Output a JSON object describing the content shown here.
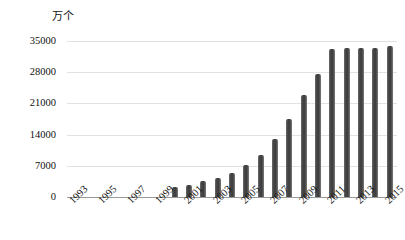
{
  "chart": {
    "unit_label": "万个",
    "y_axis": {
      "ticks": [
        "0",
        "7000",
        "14000",
        "21000",
        "28000",
        "35000"
      ],
      "min": 0,
      "max": 35000
    },
    "x_axis": {
      "tick_labels": [
        "1993",
        "1995",
        "1997",
        "1999",
        "2001",
        "2003",
        "2005",
        "2007",
        "2009",
        "2011",
        "2013",
        "2015"
      ]
    },
    "colors": {
      "bar": "#4a4a4a",
      "gridline": "#e2e2e2",
      "axis": "#9a9a9a",
      "text": "#111111",
      "background": "#ffffff"
    }
  },
  "chart_data": {
    "type": "bar",
    "title": "",
    "subtitle": "",
    "xlabel": "",
    "ylabel": "万个",
    "ylim": [
      0,
      35000
    ],
    "grid": true,
    "legend": null,
    "categories": [
      "1993",
      "1994",
      "1995",
      "1996",
      "1997",
      "1998",
      "1999",
      "2000",
      "2001",
      "2002",
      "2003",
      "2004",
      "2005",
      "2006",
      "2007",
      "2008",
      "2009",
      "2010",
      "2011",
      "2012",
      "2013",
      "2014",
      "2015"
    ],
    "values": [
      0,
      0,
      0,
      0,
      0,
      0,
      0,
      2200,
      2800,
      3500,
      4300,
      5500,
      7100,
      9500,
      13100,
      17500,
      23000,
      27500,
      33300,
      33400,
      33400,
      33500,
      33800
    ],
    "y_tick_values": [
      0,
      7000,
      14000,
      21000,
      28000,
      35000
    ],
    "x_tick_labels_shown": [
      "1993",
      "1995",
      "1997",
      "1999",
      "2001",
      "2003",
      "2005",
      "2007",
      "2009",
      "2011",
      "2013",
      "2015"
    ]
  }
}
